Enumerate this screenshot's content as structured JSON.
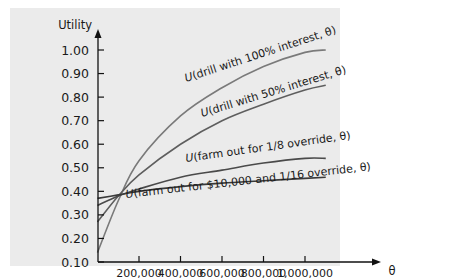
{
  "chart_data": {
    "type": "line",
    "title": "",
    "xlabel": "θ",
    "ylabel": "Utility",
    "ylim": [
      0.1,
      1.0
    ],
    "xlim": [
      0,
      1100000
    ],
    "grid": false,
    "legend": "inline labels on curves",
    "yticks": [
      "1.00",
      "0.90",
      "0.80",
      "0.70",
      "0.60",
      "0.50",
      "0.40",
      "0.30",
      "0.20",
      "0.10"
    ],
    "xticks": [
      "200,000",
      "400,000",
      "600,000",
      "800,000",
      "1,000,000"
    ],
    "x": [
      0,
      100000,
      200000,
      400000,
      600000,
      800000,
      1000000,
      1100000
    ],
    "series": [
      {
        "name": "U(drill with 100% interest, θ)",
        "values": [
          0.14,
          0.36,
          0.53,
          0.72,
          0.84,
          0.93,
          0.99,
          1.0
        ],
        "color": "#7a7a7a"
      },
      {
        "name": "U(drill with 50% interest, θ)",
        "values": [
          0.27,
          0.38,
          0.47,
          0.6,
          0.7,
          0.77,
          0.83,
          0.85
        ],
        "color": "#5e5e5e"
      },
      {
        "name": "U(farm out for 1/8 override, θ)",
        "values": [
          0.34,
          0.38,
          0.41,
          0.46,
          0.49,
          0.52,
          0.54,
          0.54
        ],
        "color": "#4a4a4a"
      },
      {
        "name": "U(farm out for $10,000 and 1/16 override, θ)",
        "values": [
          0.37,
          0.385,
          0.4,
          0.42,
          0.435,
          0.445,
          0.455,
          0.46
        ],
        "color": "#3a3a3a"
      }
    ],
    "labels": {
      "drill100": {
        "italic": "U",
        "rest": "(drill with 100% interest, θ)"
      },
      "drill50": {
        "italic": "U",
        "rest": "(drill with 50% interest, θ)"
      },
      "farm18": {
        "italic": "U",
        "rest": "(farm out for 1/8 override, θ)"
      },
      "farm116": {
        "italic": "U",
        "rest": "(farm out for $10,000 and 1/16 override, θ)"
      }
    }
  },
  "colors": {
    "panel_bg": "#ebebeb",
    "axis": "#111111"
  }
}
